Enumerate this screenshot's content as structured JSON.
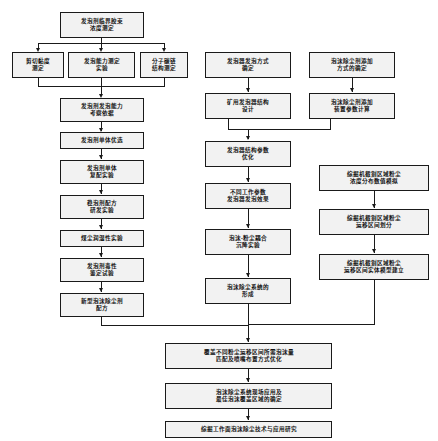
{
  "diagram": {
    "background_color": "#ffffff",
    "node_fill_color": "#f2f2f2",
    "node_border_color": "#1a1a1a",
    "edge_color": "#1a1a1a",
    "nodes": [
      {
        "id": "n01",
        "label": "发泡剂临界胶束\n浓度测定",
        "line1": "发泡剂临界胶束",
        "line2": "浓度测定"
      },
      {
        "id": "n02",
        "label": "剪切黏度\n测定",
        "line1": "剪切黏度",
        "line2": "测定"
      },
      {
        "id": "n03",
        "label": "发泡能力测定\n实验",
        "line1": "发泡能力测定",
        "line2": "实验"
      },
      {
        "id": "n04",
        "label": "分子碳链\n结构测定",
        "line1": "分子碳链",
        "line2": "结构测定"
      },
      {
        "id": "n05",
        "label": "发泡剂发泡能力\n考察依据",
        "line1": "发泡剂发泡能力",
        "line2": "考察依据"
      },
      {
        "id": "n06",
        "label": "发泡剂单体优选",
        "line1": "发泡剂单体优选",
        "line2": ""
      },
      {
        "id": "n07",
        "label": "发泡剂单体\n复配实验",
        "line1": "发泡剂单体",
        "line2": "复配实验"
      },
      {
        "id": "n08",
        "label": "稳泡剂配方\n研发实验",
        "line1": "稳泡剂配方",
        "line2": "研发实验"
      },
      {
        "id": "n09",
        "label": "煤尘润湿性实验",
        "line1": "煤尘润湿性实验",
        "line2": ""
      },
      {
        "id": "n10",
        "label": "发泡剂毒性\n鉴定试验",
        "line1": "发泡剂毒性",
        "line2": "鉴定试验"
      },
      {
        "id": "n11",
        "label": "新型泡沫除尘剂\n配方",
        "line1": "新型泡沫除尘剂",
        "line2": "配方"
      },
      {
        "id": "n12",
        "label": "发泡器发泡方式\n确定",
        "line1": "发泡器发泡方式",
        "line2": "确定"
      },
      {
        "id": "n13",
        "label": "矿用发泡器结构\n设计",
        "line1": "矿用发泡器结构",
        "line2": "设计"
      },
      {
        "id": "n14",
        "label": "泡沫除尘剂添加\n方式的确定",
        "line1": "泡沫除尘剂添加",
        "line2": "方式的确定"
      },
      {
        "id": "n15",
        "label": "泡沫除尘剂添加\n装置参数计算",
        "line1": "泡沫除尘剂添加",
        "line2": "装置参数计算"
      },
      {
        "id": "n16",
        "label": "发泡器结构参数\n优化",
        "line1": "发泡器结构参数",
        "line2": "优化"
      },
      {
        "id": "n17",
        "label": "不同工作参数\n发泡器发泡效果",
        "line1": "不同工作参数",
        "line2": "发泡器发泡效果"
      },
      {
        "id": "n18",
        "label": "泡沫-粉尘耦合\n沉降实验",
        "line1": "泡沫-粉尘耦合",
        "line2": "沉降实验"
      },
      {
        "id": "n19",
        "label": "泡沫除尘系统的\n形成",
        "line1": "泡沫除尘系统的",
        "line2": "形成"
      },
      {
        "id": "n20",
        "label": "综掘机截割区域粉尘\n浓度分布数值模拟",
        "line1": "综掘机截割区域粉尘",
        "line2": "浓度分布数值模拟"
      },
      {
        "id": "n21",
        "label": "综掘机截割区域粉尘\n运移区间划分",
        "line1": "综掘机截割区域粉尘",
        "line2": "运移区间划分"
      },
      {
        "id": "n22",
        "label": "综掘机截割区域粉尘\n运移区间实体模型建立",
        "line1": "综掘机截割区域粉尘",
        "line2": "运移区间实体模型建立"
      },
      {
        "id": "n23",
        "label": "覆盖不同粉尘运移区间所需泡沫量\n匹配及喷嘴布置方式优化",
        "line1": "覆盖不同粉尘运移区间所需泡沫量",
        "line2": "匹配及喷嘴布置方式优化"
      },
      {
        "id": "n24",
        "label": "泡沫除尘系统现场应用及\n最佳泡沫覆盖区域的确定",
        "line1": "泡沫除尘系统现场应用及",
        "line2": "最佳泡沫覆盖区域的确定"
      },
      {
        "id": "n25",
        "label": "综掘工作面泡沫除尘技术与应用研究",
        "line1": "综掘工作面泡沫除尘技术与应用研究",
        "line2": ""
      }
    ]
  }
}
